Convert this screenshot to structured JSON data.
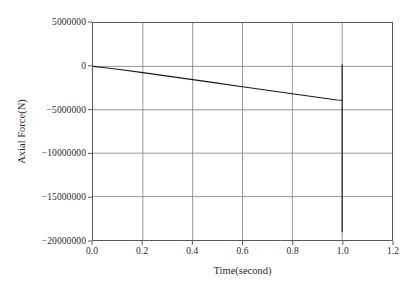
{
  "chart_data": {
    "type": "line",
    "title": "",
    "xlabel": "Time(second)",
    "ylabel": "Axial Force(N)",
    "xlim": [
      0.0,
      1.2
    ],
    "ylim": [
      -20000000,
      5000000
    ],
    "xticks": [
      0.0,
      0.2,
      0.4,
      0.6,
      0.8,
      1.0,
      1.2
    ],
    "xtick_labels": [
      "0.0",
      "0.2",
      "0.4",
      "0.6",
      "0.8",
      "1.0",
      "1.2"
    ],
    "yticks": [
      5000000,
      0,
      -5000000,
      -10000000,
      -15000000,
      -20000000
    ],
    "ytick_labels": [
      "5000000",
      "0",
      "−5000000",
      "−10000000",
      "−15000000",
      "−20000000"
    ],
    "grid": true,
    "legend": null,
    "series": [
      {
        "name": "Axial Force",
        "color": "#1a1a1a",
        "linewidth": 1.1,
        "x": [
          0.0,
          0.05,
          0.1,
          0.2,
          0.3,
          0.4,
          0.5,
          0.6,
          0.7,
          0.8,
          0.9,
          0.98,
          1.0,
          1.0,
          1.0,
          1.0
        ],
        "y": [
          0,
          -150000,
          -330000,
          -720000,
          -1120000,
          -1520000,
          -1930000,
          -2340000,
          -2750000,
          -3150000,
          -3560000,
          -3880000,
          -3900000,
          250000,
          -19100000,
          -3900000
        ]
      }
    ],
    "annotations": [
      {
        "text": "vertical spike at t = 1.0 s spanning from about +250000 N down to about -19100000 N",
        "x": 1.0
      }
    ]
  },
  "colors": {
    "background": "#ffffff",
    "frame": "#5a5a5a",
    "grid": "#7d7d7d",
    "series": "#1a1a1a",
    "text": "#2b2b2b"
  }
}
